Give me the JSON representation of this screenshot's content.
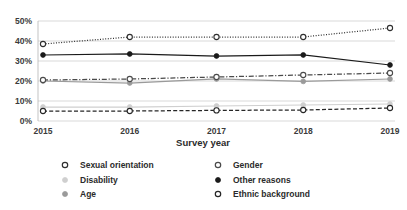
{
  "chart_data": {
    "type": "line",
    "title": "",
    "xlabel": "Survey year",
    "ylabel": "",
    "categories": [
      "2015",
      "2016",
      "2017",
      "2018",
      "2019"
    ],
    "x": [
      2015,
      2016,
      2017,
      2018,
      2019
    ],
    "ylim": [
      0,
      50
    ],
    "ytick_labels": [
      "0%",
      "10%",
      "20%",
      "30%",
      "40%",
      "50%"
    ],
    "ytick_values": [
      0,
      10,
      20,
      30,
      40,
      50
    ],
    "grid": true,
    "legend_position": "bottom",
    "series": [
      {
        "name": "Sexual orientation",
        "values": [
          38.5,
          42.0,
          42.0,
          42.0,
          46.5
        ],
        "color": "#2f2f2f",
        "style": "dotted",
        "marker": "open-circle"
      },
      {
        "name": "Gender",
        "values": [
          20.5,
          21.0,
          22.0,
          23.0,
          24.0
        ],
        "color": "#4a4a4a",
        "style": "dash-dot",
        "marker": "open-circle"
      },
      {
        "name": "Disability",
        "values": [
          7.0,
          7.0,
          7.5,
          8.0,
          8.5
        ],
        "color": "#cfcfcf",
        "style": "solid",
        "marker": "filled-circle"
      },
      {
        "name": "Other reasons",
        "values": [
          33.0,
          33.5,
          32.5,
          33.0,
          28.0
        ],
        "color": "#1a1a1a",
        "style": "solid",
        "marker": "filled-circle"
      },
      {
        "name": "Age",
        "values": [
          20.0,
          19.0,
          21.0,
          19.8,
          21.0
        ],
        "color": "#9a9a9a",
        "style": "solid",
        "marker": "filled-circle"
      },
      {
        "name": "Ethnic background",
        "values": [
          5.0,
          5.0,
          5.3,
          5.5,
          6.5
        ],
        "color": "#262626",
        "style": "dashed",
        "marker": "open-circle"
      }
    ]
  },
  "legend": {
    "columns": [
      [
        "Sexual orientation",
        "Disability",
        "Age"
      ],
      [
        "Gender",
        "Other reasons",
        "Ethnic background"
      ]
    ]
  },
  "axes": {
    "x_title": "Survey year"
  }
}
